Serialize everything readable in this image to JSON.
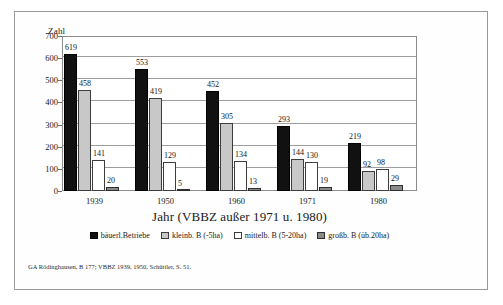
{
  "chart_data": {
    "type": "bar",
    "title": "",
    "xlabel": "Jahr (VBBZ außer 1971 u. 1980)",
    "ylabel": "Zahl",
    "ylim": [
      0,
      700
    ],
    "yticks": [
      0,
      100,
      200,
      300,
      400,
      500,
      600,
      700
    ],
    "grid": true,
    "legend_position": "bottom",
    "categories": [
      "1939",
      "1950",
      "1960",
      "1971",
      "1980"
    ],
    "series": [
      {
        "name": "bäuerl.Betriebe",
        "color": "#111111",
        "values": [
          619,
          553,
          452,
          293,
          219
        ]
      },
      {
        "name": "kleinb. B (-5ha)",
        "color": "#c8c8c8",
        "values": [
          458,
          419,
          305,
          144,
          92
        ]
      },
      {
        "name": "mittelb. B (5-20ha)",
        "color": "#ffffff",
        "values": [
          141,
          129,
          134,
          130,
          98
        ]
      },
      {
        "name": "großb. B  (üb.20ha)",
        "color": "#8a8a8a",
        "values": [
          20,
          5,
          13,
          19,
          29
        ]
      }
    ]
  },
  "source_note": "GA Rödinghausen, B 177; VBBZ 1939, 1950, Schüttler, S. 51."
}
